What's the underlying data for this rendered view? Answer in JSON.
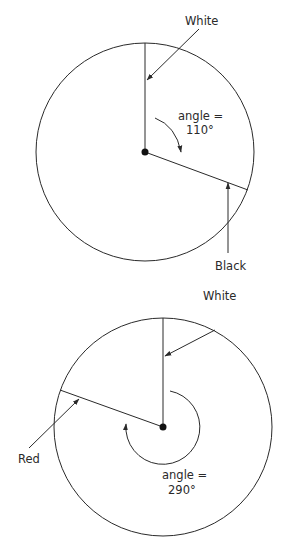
{
  "diagrams": [
    {
      "id": "top",
      "labels": {
        "start_hand": "White",
        "end_hand": "Black",
        "angle_line1": "angle =",
        "angle_line2": "110°"
      },
      "angle_degrees": 110
    },
    {
      "id": "bottom",
      "labels": {
        "start_hand": "White",
        "end_hand": "Red",
        "angle_line1": "angle =",
        "angle_line2": "290°"
      },
      "angle_degrees": 290
    }
  ],
  "colors": {
    "stroke": "#2a2a2a",
    "background": "#ffffff"
  }
}
